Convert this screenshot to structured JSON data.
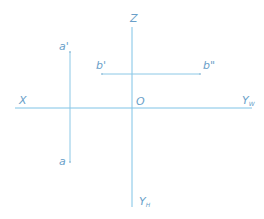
{
  "diagram": {
    "type": "orthographic-projection-axes",
    "colors": {
      "line": "#8cc8e6",
      "axis": "#7ec3e6",
      "label": "#6a9fc9",
      "point": "#9cc4dc"
    },
    "axes": {
      "x_label": "X",
      "z_label": "Z",
      "origin_label": "O",
      "yw_label": "Y",
      "yw_sub": "W",
      "yh_label": "Y",
      "yh_sub": "H"
    },
    "points": {
      "a_prime": "a'",
      "a": "a",
      "b_prime": "b'",
      "b_double_prime": "b\""
    }
  }
}
